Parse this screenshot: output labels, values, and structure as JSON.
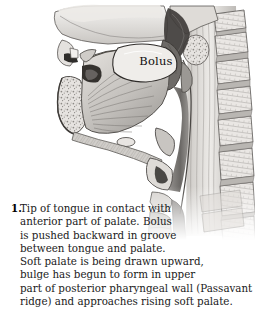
{
  "figure": {
    "type": "anatomical-illustration",
    "style": "grayscale-halftone-engraving",
    "labels": [
      {
        "name": "bolus",
        "text": "Bolus"
      }
    ],
    "structures": [
      "hard palate",
      "soft palate",
      "tongue",
      "genioglossus muscle fibers",
      "mandible",
      "oral cavity",
      "nasopharynx",
      "posterior pharyngeal wall",
      "epiglottis",
      "larynx",
      "trachea",
      "hyoid bone",
      "cervical vertebrae"
    ],
    "colors": {
      "background": "#ffffff",
      "ink": "#2b2b2b",
      "light_tissue": "#e8e6e3",
      "mid_tissue": "#bdbab6",
      "dark_tissue": "#6e6b68",
      "deep_shadow": "#3a3836",
      "bolus_fill": "#efedea"
    }
  },
  "caption": {
    "number": "1.",
    "lines": [
      "Tip of tongue in contact with",
      "anterior part of palate. Bolus",
      "is pushed backward in groove",
      "between tongue and palate.",
      "Soft palate is being drawn upward,",
      "bulge has begun to form in upper",
      "part of posterior pharyngeal wall (Passavant",
      "ridge) and approaches rising soft palate."
    ],
    "full_text": "Tip of tongue in contact with anterior part of palate. Bolus is pushed backward in groove between tongue and palate. Soft palate is being drawn upward, bulge has begun to form in upper part of posterior pharyngeal wall (Passavant ridge) and approaches rising soft palate."
  }
}
